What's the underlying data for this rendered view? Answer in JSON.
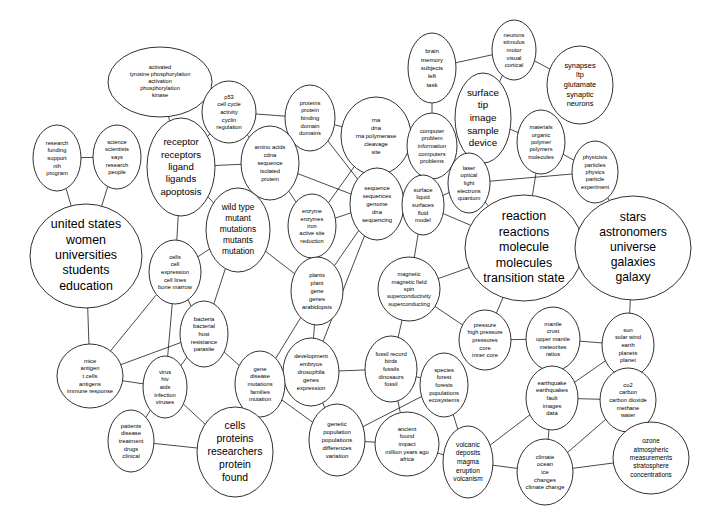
{
  "diagram": {
    "type": "cluster-network-map",
    "background_color": "#ffffff",
    "node_fill": "#ffffff",
    "node_stroke": "#1a1a1a",
    "edge_color": "#1a1a1a",
    "width": 722,
    "height": 530
  },
  "nodes": [
    {
      "id": "activated-tyrosine",
      "cx": 160,
      "cy": 82,
      "rx": 52,
      "ry": 35,
      "font_size": 5.6,
      "line_height": 7.2,
      "lines": [
        "activated",
        "tyrosine phosphorylation",
        "activation",
        "phosphorylation",
        "kinase"
      ]
    },
    {
      "id": "p53-cell-cycle",
      "cx": 229,
      "cy": 112,
      "rx": 27,
      "ry": 31,
      "font_size": 5.8,
      "line_height": 7.6,
      "lines": [
        "p53",
        "cell cycle",
        "activity",
        "cyclin",
        "regulation"
      ]
    },
    {
      "id": "proteins-protein-binding",
      "cx": 310,
      "cy": 118,
      "rx": 25,
      "ry": 33,
      "font_size": 5.8,
      "line_height": 7.6,
      "lines": [
        "proteins",
        "protein",
        "binding",
        "domain",
        "domains"
      ]
    },
    {
      "id": "rna-dna-polymerase",
      "cx": 376,
      "cy": 136,
      "rx": 35,
      "ry": 39,
      "font_size": 5.9,
      "line_height": 8.2,
      "lines": [
        "rna",
        "dna",
        "rna polymerase",
        "cleavage",
        "site"
      ]
    },
    {
      "id": "brain-memory",
      "cx": 432,
      "cy": 68,
      "rx": 24,
      "ry": 35,
      "font_size": 6.1,
      "line_height": 8.4,
      "lines": [
        "brain",
        "memory",
        "subjects",
        "left",
        "task"
      ]
    },
    {
      "id": "neurons-stimulus",
      "cx": 514,
      "cy": 50,
      "rx": 22,
      "ry": 30,
      "font_size": 5.8,
      "line_height": 7.6,
      "lines": [
        "neurons",
        "stimulus",
        "motor",
        "visual",
        "cortical"
      ]
    },
    {
      "id": "synapses-ltp",
      "cx": 580,
      "cy": 85,
      "rx": 33,
      "ry": 39,
      "font_size": 7.4,
      "line_height": 9.6,
      "lines": [
        "synapses",
        "ltp",
        "glutamate",
        "synaptic",
        "neurons"
      ]
    },
    {
      "id": "surface-tip-image",
      "cx": 483,
      "cy": 118,
      "rx": 28,
      "ry": 45,
      "font_size": 9.8,
      "line_height": 12.6,
      "lines": [
        "surface",
        "tip",
        "image",
        "sample",
        "device"
      ]
    },
    {
      "id": "materials-organic-polymer",
      "cx": 541,
      "cy": 142,
      "rx": 24,
      "ry": 32,
      "font_size": 5.7,
      "line_height": 7.4,
      "lines": [
        "materials",
        "organic",
        "polymer",
        "polymers",
        "molecules"
      ]
    },
    {
      "id": "physicists-particles",
      "cx": 595,
      "cy": 172,
      "rx": 23,
      "ry": 31,
      "font_size": 5.7,
      "line_height": 7.4,
      "lines": [
        "physicists",
        "particles",
        "physics",
        "particle",
        "experiment"
      ]
    },
    {
      "id": "computer-problem",
      "cx": 432,
      "cy": 146,
      "rx": 25,
      "ry": 33,
      "font_size": 5.8,
      "line_height": 7.6,
      "lines": [
        "computer",
        "problem",
        "information",
        "computers",
        "problems"
      ]
    },
    {
      "id": "laser-optical-light",
      "cx": 469,
      "cy": 183,
      "rx": 21,
      "ry": 30,
      "font_size": 5.8,
      "line_height": 7.6,
      "lines": [
        "laser",
        "optical",
        "light",
        "electrons",
        "quantum"
      ]
    },
    {
      "id": "research-funding",
      "cx": 57,
      "cy": 158,
      "rx": 24,
      "ry": 33,
      "font_size": 5.8,
      "line_height": 7.6,
      "lines": [
        "research",
        "funding",
        "support",
        "nih",
        "program"
      ]
    },
    {
      "id": "science-scientists",
      "cx": 117,
      "cy": 157,
      "rx": 24,
      "ry": 32,
      "font_size": 5.8,
      "line_height": 7.6,
      "lines": [
        "science",
        "scientists",
        "says",
        "research",
        "people"
      ]
    },
    {
      "id": "receptor-ligand",
      "cx": 181,
      "cy": 167,
      "rx": 34,
      "ry": 49,
      "font_size": 9.6,
      "line_height": 12.4,
      "lines": [
        "receptor",
        "receptors",
        "ligand",
        "ligands",
        "apoptosis"
      ]
    },
    {
      "id": "amino-acids-cdna",
      "cx": 270,
      "cy": 163,
      "rx": 29,
      "ry": 37,
      "font_size": 5.8,
      "line_height": 8.0,
      "lines": [
        "amino acids",
        "cdna",
        "sequence",
        "isolated",
        "protein"
      ]
    },
    {
      "id": "sequence-genome",
      "cx": 377,
      "cy": 204,
      "rx": 27,
      "ry": 36,
      "font_size": 5.9,
      "line_height": 7.8,
      "lines": [
        "sequence",
        "sequences",
        "genome",
        "dna",
        "sequencing"
      ]
    },
    {
      "id": "surface-liquid",
      "cx": 423,
      "cy": 205,
      "rx": 21,
      "ry": 30,
      "font_size": 5.8,
      "line_height": 7.6,
      "lines": [
        "surface",
        "liquid",
        "surfaces",
        "fluid",
        "model"
      ]
    },
    {
      "id": "wild-type-mutant",
      "cx": 238,
      "cy": 230,
      "rx": 32,
      "ry": 42,
      "font_size": 8.4,
      "line_height": 10.8,
      "lines": [
        "wild type",
        "mutant",
        "mutations",
        "mutants",
        "mutation"
      ]
    },
    {
      "id": "enzyme-enzymes-iron",
      "cx": 312,
      "cy": 226,
      "rx": 24,
      "ry": 32,
      "font_size": 5.7,
      "line_height": 7.4,
      "lines": [
        "enzyme",
        "enzymes",
        "iron",
        "active site",
        "reduction"
      ]
    },
    {
      "id": "reaction-molecule",
      "cx": 524,
      "cy": 248,
      "rx": 59,
      "ry": 53,
      "font_size": 12.5,
      "line_height": 15.5,
      "lines": [
        "reaction",
        "reactions",
        "molecule",
        "molecules",
        "transition state"
      ]
    },
    {
      "id": "stars-astronomers",
      "cx": 633,
      "cy": 248,
      "rx": 58,
      "ry": 52,
      "font_size": 12.2,
      "line_height": 15.2,
      "lines": [
        "stars",
        "astronomers",
        "universe",
        "galaxies",
        "galaxy"
      ]
    },
    {
      "id": "united-states-women",
      "cx": 86,
      "cy": 256,
      "rx": 56,
      "ry": 52,
      "font_size": 12.4,
      "line_height": 15.4,
      "lines": [
        "united states",
        "women",
        "universities",
        "students",
        "education"
      ]
    },
    {
      "id": "cells-cell-expression",
      "cx": 175,
      "cy": 272,
      "rx": 26,
      "ry": 32,
      "font_size": 5.8,
      "line_height": 7.6,
      "lines": [
        "cells",
        "cell",
        "expression",
        "cell lines",
        "bone marrow"
      ]
    },
    {
      "id": "magnetic-field-spin",
      "cx": 409,
      "cy": 289,
      "rx": 31,
      "ry": 32,
      "font_size": 5.7,
      "line_height": 7.4,
      "lines": [
        "magnetic",
        "magnetic field",
        "spin",
        "superconductivity",
        "superconducting"
      ]
    },
    {
      "id": "plants-plant-gene",
      "cx": 317,
      "cy": 291,
      "rx": 26,
      "ry": 34,
      "font_size": 5.9,
      "line_height": 7.8,
      "lines": [
        "plants",
        "plant",
        "gene",
        "genes",
        "arabidopsis"
      ]
    },
    {
      "id": "pressure-core",
      "cx": 485,
      "cy": 340,
      "rx": 26,
      "ry": 30,
      "font_size": 5.8,
      "line_height": 7.6,
      "lines": [
        "pressure",
        "high pressure",
        "pressures",
        "core",
        "inner core"
      ]
    },
    {
      "id": "mantle-crust",
      "cx": 553,
      "cy": 339,
      "rx": 27,
      "ry": 32,
      "font_size": 5.8,
      "line_height": 7.6,
      "lines": [
        "mantle",
        "crust",
        "upper mantle",
        "meteorites",
        "ratios"
      ]
    },
    {
      "id": "sun-solar-wind",
      "cx": 628,
      "cy": 345,
      "rx": 26,
      "ry": 32,
      "font_size": 5.8,
      "line_height": 7.6,
      "lines": [
        "sun",
        "solar wind",
        "earth",
        "planets",
        "planet"
      ]
    },
    {
      "id": "bacteria-host",
      "cx": 204,
      "cy": 334,
      "rx": 24,
      "ry": 33,
      "font_size": 5.8,
      "line_height": 7.6,
      "lines": [
        "bacteria",
        "bacterial",
        "host",
        "resistance",
        "parasite"
      ]
    },
    {
      "id": "development-embryos",
      "cx": 311,
      "cy": 372,
      "rx": 28,
      "ry": 34,
      "font_size": 5.9,
      "line_height": 7.8,
      "lines": [
        "development",
        "embryos",
        "drosophila",
        "genes",
        "expression"
      ]
    },
    {
      "id": "fossil-record-birds",
      "cx": 391,
      "cy": 369,
      "rx": 26,
      "ry": 33,
      "font_size": 5.8,
      "line_height": 7.6,
      "lines": [
        "fossil record",
        "birds",
        "fossils",
        "dinosaurs",
        "fossil"
      ]
    },
    {
      "id": "species-forest",
      "cx": 444,
      "cy": 385,
      "rx": 24,
      "ry": 32,
      "font_size": 5.8,
      "line_height": 7.6,
      "lines": [
        "species",
        "forest",
        "forests",
        "populations",
        "ecosystems"
      ]
    },
    {
      "id": "earthquake-fault",
      "cx": 552,
      "cy": 398,
      "rx": 26,
      "ry": 32,
      "font_size": 5.8,
      "line_height": 7.6,
      "lines": [
        "earthquake",
        "earthquakes",
        "fault",
        "images",
        "data"
      ]
    },
    {
      "id": "co2-carbon",
      "cx": 628,
      "cy": 400,
      "rx": 28,
      "ry": 32,
      "font_size": 5.8,
      "line_height": 7.6,
      "lines": [
        "co2",
        "carbon",
        "carbon dioxide",
        "methane",
        "water"
      ]
    },
    {
      "id": "mice-antigen",
      "cx": 90,
      "cy": 376,
      "rx": 33,
      "ry": 32,
      "font_size": 5.8,
      "line_height": 7.6,
      "lines": [
        "mice",
        "antigen",
        "t cells",
        "antigens",
        "immune response"
      ]
    },
    {
      "id": "virus-hiv-aids",
      "cx": 165,
      "cy": 387,
      "rx": 22,
      "ry": 31,
      "font_size": 5.8,
      "line_height": 7.6,
      "lines": [
        "virus",
        "hiv",
        "aids",
        "infection",
        "viruses"
      ]
    },
    {
      "id": "gene-disease-mutations",
      "cx": 260,
      "cy": 384,
      "rx": 25,
      "ry": 33,
      "font_size": 5.8,
      "line_height": 7.6,
      "lines": [
        "gene",
        "disease",
        "mutations",
        "families",
        "mutation"
      ]
    },
    {
      "id": "patients-disease",
      "cx": 131,
      "cy": 441,
      "rx": 23,
      "ry": 31,
      "font_size": 5.8,
      "line_height": 7.6,
      "lines": [
        "patients",
        "disease",
        "treatment",
        "drugs",
        "clinical"
      ]
    },
    {
      "id": "cells-proteins-researchers",
      "cx": 235,
      "cy": 452,
      "rx": 38,
      "ry": 45,
      "font_size": 10.4,
      "line_height": 13.2,
      "lines": [
        "cells",
        "proteins",
        "researchers",
        "protein",
        "found"
      ]
    },
    {
      "id": "genetic-population",
      "cx": 337,
      "cy": 440,
      "rx": 28,
      "ry": 36,
      "font_size": 6.0,
      "line_height": 8.0,
      "lines": [
        "genetic",
        "population",
        "populations",
        "differences",
        "variation"
      ]
    },
    {
      "id": "ancient-found-impact",
      "cx": 407,
      "cy": 444,
      "rx": 32,
      "ry": 32,
      "font_size": 5.8,
      "line_height": 7.6,
      "lines": [
        "ancient",
        "found",
        "impact",
        "million years ago",
        "africa"
      ]
    },
    {
      "id": "volcanic-magma",
      "cx": 468,
      "cy": 462,
      "rx": 25,
      "ry": 36,
      "font_size": 6.6,
      "line_height": 8.6,
      "lines": [
        "volcanic",
        "deposits",
        "magma",
        "eruption",
        "volcanism"
      ]
    },
    {
      "id": "climate-ocean-ice",
      "cx": 545,
      "cy": 472,
      "rx": 28,
      "ry": 33,
      "font_size": 5.8,
      "line_height": 7.6,
      "lines": [
        "climate",
        "ocean",
        "ice",
        "changes",
        "climate change"
      ]
    },
    {
      "id": "ozone-atmospheric",
      "cx": 651,
      "cy": 458,
      "rx": 38,
      "ry": 36,
      "font_size": 6.4,
      "line_height": 8.4,
      "lines": [
        "ozone",
        "atmospheric",
        "measurements",
        "stratosphere",
        "concentrations"
      ]
    }
  ],
  "edges": [
    [
      "research-funding",
      "science-scientists"
    ],
    [
      "research-funding",
      "united-states-women"
    ],
    [
      "science-scientists",
      "united-states-women"
    ],
    [
      "activated-tyrosine",
      "p53-cell-cycle"
    ],
    [
      "activated-tyrosine",
      "receptor-ligand"
    ],
    [
      "p53-cell-cycle",
      "amino-acids-cdna"
    ],
    [
      "p53-cell-cycle",
      "proteins-protein-binding"
    ],
    [
      "p53-cell-cycle",
      "receptor-ligand"
    ],
    [
      "receptor-ligand",
      "amino-acids-cdna"
    ],
    [
      "receptor-ligand",
      "cells-cell-expression"
    ],
    [
      "receptor-ligand",
      "wild-type-mutant"
    ],
    [
      "proteins-protein-binding",
      "amino-acids-cdna"
    ],
    [
      "proteins-protein-binding",
      "rna-dna-polymerase"
    ],
    [
      "proteins-protein-binding",
      "sequence-genome"
    ],
    [
      "amino-acids-cdna",
      "enzyme-enzymes-iron"
    ],
    [
      "amino-acids-cdna",
      "wild-type-mutant"
    ],
    [
      "amino-acids-cdna",
      "sequence-genome"
    ],
    [
      "rna-dna-polymerase",
      "sequence-genome"
    ],
    [
      "rna-dna-polymerase",
      "computer-problem"
    ],
    [
      "rna-dna-polymerase",
      "enzyme-enzymes-iron"
    ],
    [
      "brain-memory",
      "neurons-stimulus"
    ],
    [
      "brain-memory",
      "computer-problem"
    ],
    [
      "neurons-stimulus",
      "synapses-ltp"
    ],
    [
      "neurons-stimulus",
      "surface-tip-image"
    ],
    [
      "surface-tip-image",
      "materials-organic-polymer"
    ],
    [
      "surface-tip-image",
      "laser-optical-light"
    ],
    [
      "materials-organic-polymer",
      "physicists-particles"
    ],
    [
      "materials-organic-polymer",
      "reaction-molecule"
    ],
    [
      "computer-problem",
      "laser-optical-light"
    ],
    [
      "computer-problem",
      "surface-liquid"
    ],
    [
      "laser-optical-light",
      "physicists-particles"
    ],
    [
      "laser-optical-light",
      "reaction-molecule"
    ],
    [
      "laser-optical-light",
      "surface-liquid"
    ],
    [
      "physicists-particles",
      "stars-astronomers"
    ],
    [
      "reaction-molecule",
      "surface-liquid"
    ],
    [
      "reaction-molecule",
      "magnetic-field-spin"
    ],
    [
      "reaction-molecule",
      "pressure-core"
    ],
    [
      "reaction-molecule",
      "stars-astronomers"
    ],
    [
      "surface-liquid",
      "magnetic-field-spin"
    ],
    [
      "surface-liquid",
      "sequence-genome"
    ],
    [
      "sequence-genome",
      "enzyme-enzymes-iron"
    ],
    [
      "sequence-genome",
      "plants-plant-gene"
    ],
    [
      "sequence-genome",
      "development-embryos"
    ],
    [
      "enzyme-enzymes-iron",
      "plants-plant-gene"
    ],
    [
      "wild-type-mutant",
      "cells-cell-expression"
    ],
    [
      "wild-type-mutant",
      "bacteria-host"
    ],
    [
      "wild-type-mutant",
      "plants-plant-gene"
    ],
    [
      "united-states-women",
      "mice-antigen"
    ],
    [
      "cells-cell-expression",
      "bacteria-host"
    ],
    [
      "cells-cell-expression",
      "mice-antigen"
    ],
    [
      "cells-cell-expression",
      "virus-hiv-aids"
    ],
    [
      "bacteria-host",
      "virus-hiv-aids"
    ],
    [
      "bacteria-host",
      "gene-disease-mutations"
    ],
    [
      "plants-plant-gene",
      "development-embryos"
    ],
    [
      "plants-plant-gene",
      "gene-disease-mutations"
    ],
    [
      "mice-antigen",
      "virus-hiv-aids"
    ],
    [
      "mice-antigen",
      "bacteria-host"
    ],
    [
      "virus-hiv-aids",
      "patients-disease"
    ],
    [
      "virus-hiv-aids",
      "cells-proteins-researchers"
    ],
    [
      "gene-disease-mutations",
      "development-embryos"
    ],
    [
      "gene-disease-mutations",
      "genetic-population"
    ],
    [
      "gene-disease-mutations",
      "cells-proteins-researchers"
    ],
    [
      "patients-disease",
      "cells-proteins-researchers"
    ],
    [
      "development-embryos",
      "genetic-population"
    ],
    [
      "development-embryos",
      "fossil-record-birds"
    ],
    [
      "magnetic-field-spin",
      "pressure-core"
    ],
    [
      "magnetic-field-spin",
      "fossil-record-birds"
    ],
    [
      "fossil-record-birds",
      "species-forest"
    ],
    [
      "fossil-record-birds",
      "ancient-found-impact"
    ],
    [
      "species-forest",
      "genetic-population"
    ],
    [
      "species-forest",
      "volcanic-magma"
    ],
    [
      "pressure-core",
      "mantle-crust"
    ],
    [
      "mantle-crust",
      "sun-solar-wind"
    ],
    [
      "mantle-crust",
      "earthquake-fault"
    ],
    [
      "sun-solar-wind",
      "co2-carbon"
    ],
    [
      "sun-solar-wind",
      "earthquake-fault"
    ],
    [
      "earthquake-fault",
      "co2-carbon"
    ],
    [
      "earthquake-fault",
      "climate-ocean-ice"
    ],
    [
      "earthquake-fault",
      "volcanic-magma"
    ],
    [
      "co2-carbon",
      "ozone-atmospheric"
    ],
    [
      "co2-carbon",
      "climate-ocean-ice"
    ],
    [
      "climate-ocean-ice",
      "ozone-atmospheric"
    ],
    [
      "climate-ocean-ice",
      "volcanic-magma"
    ],
    [
      "ancient-found-impact",
      "volcanic-magma"
    ],
    [
      "ancient-found-impact",
      "genetic-population"
    ],
    [
      "stars-astronomers",
      "sun-solar-wind"
    ]
  ]
}
